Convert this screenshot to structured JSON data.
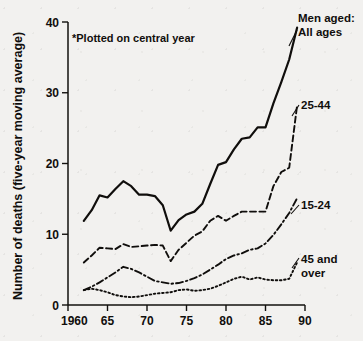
{
  "figure": {
    "annotation": "*Plotted on central year",
    "ylabel": "Number of deaths (five-year moving average)",
    "legend_title": "Men aged:",
    "label_all": "All ages",
    "label_2544": "25-44",
    "label_1524": "15-24",
    "label_45_line1": "45 and",
    "label_45_line2": "over",
    "ink_color": "#100e0c",
    "paper_color": "#f2f1ef"
  },
  "axis": {
    "y_ticks": [
      "0",
      "10",
      "20",
      "30",
      "40"
    ],
    "x_ticks": [
      "1960",
      "65",
      "70",
      "75",
      "80",
      "85",
      "90"
    ]
  },
  "chart_data": {
    "type": "line",
    "title": "",
    "subtitle": "",
    "xlabel": "",
    "ylabel": "Number of deaths (five-year moving average)",
    "xlim": [
      1960,
      90
    ],
    "ylim": [
      0,
      40
    ],
    "grid": false,
    "legend_position": "right-inline",
    "annotations": [
      "*Plotted on central year"
    ],
    "x_tick_values": [
      1960,
      1965,
      1970,
      1975,
      1980,
      1985,
      1990
    ],
    "x_tick_labels": [
      "1960",
      "65",
      "70",
      "75",
      "80",
      "85",
      "90"
    ],
    "y_tick_values": [
      0,
      10,
      20,
      30,
      40
    ],
    "y_tick_labels": [
      "0",
      "10",
      "20",
      "30",
      "40"
    ],
    "x": [
      1962,
      1963,
      1964,
      1965,
      1966,
      1967,
      1968,
      1969,
      1970,
      1971,
      1972,
      1973,
      1974,
      1975,
      1976,
      1977,
      1978,
      1979,
      1980,
      1981,
      1982,
      1983,
      1984,
      1985,
      1986,
      1987,
      1988,
      1989
    ],
    "series": [
      {
        "name": "All ages",
        "style": "solid",
        "label_position": "top-right",
        "values": [
          11.9,
          13.4,
          15.5,
          15.2,
          16.4,
          17.5,
          16.8,
          15.6,
          15.6,
          15.4,
          14.1,
          10.5,
          12.0,
          12.8,
          13.2,
          14.3,
          17.1,
          19.8,
          20.2,
          22.0,
          23.5,
          23.7,
          25.1,
          25.1,
          28.5,
          31.5,
          34.7,
          39.2
        ]
      },
      {
        "name": "25-44",
        "style": "dashed",
        "label_position": "right",
        "values": [
          6.0,
          7.0,
          8.1,
          8.0,
          7.9,
          8.6,
          8.2,
          8.3,
          8.4,
          8.5,
          8.4,
          6.2,
          7.8,
          8.8,
          9.8,
          10.4,
          11.9,
          12.6,
          11.9,
          12.6,
          13.2,
          13.2,
          13.2,
          13.2,
          16.8,
          18.8,
          19.4,
          28.2
        ]
      },
      {
        "name": "15-24",
        "style": "dash-dot",
        "label_position": "right",
        "values": [
          2.1,
          2.6,
          3.2,
          3.9,
          4.6,
          5.4,
          5.1,
          4.6,
          4.0,
          3.4,
          3.2,
          3.0,
          3.1,
          3.4,
          3.8,
          4.3,
          5.0,
          5.7,
          6.5,
          7.0,
          7.3,
          7.8,
          8.0,
          8.7,
          9.9,
          11.4,
          13.0,
          15.1
        ]
      },
      {
        "name": "45 and over",
        "style": "dotted",
        "label_position": "right",
        "values": [
          2.1,
          2.3,
          2.1,
          1.8,
          1.4,
          1.2,
          1.1,
          1.2,
          1.4,
          1.6,
          1.7,
          1.8,
          2.1,
          2.2,
          2.0,
          2.1,
          2.3,
          2.7,
          3.2,
          3.7,
          4.0,
          3.6,
          3.9,
          3.6,
          3.5,
          3.5,
          3.7,
          6.0
        ]
      }
    ]
  }
}
